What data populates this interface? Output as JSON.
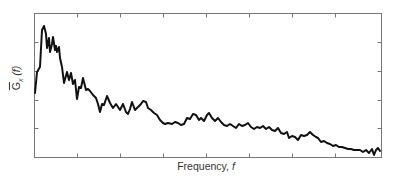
{
  "chart_data": {
    "type": "line",
    "title": "",
    "xlabel": "Frequency, f",
    "ylabel": "G_x(f) (averaged spectral density, overbar)",
    "ylabel_parts": {
      "symbol": "G",
      "subscript": "x",
      "argument": "(f)"
    },
    "xlabel_parts": {
      "text": "Frequency, ",
      "var": "f"
    },
    "x_ticks_labeled": false,
    "y_ticks_labeled": false,
    "grid": false,
    "legend": null,
    "frame": {
      "left": 34,
      "top": 13,
      "right": 381,
      "bottom": 157,
      "color": "#777777"
    },
    "x_tick_positions_px": [
      77,
      120,
      163,
      206,
      249,
      292,
      335
    ],
    "y_tick_positions_px": [
      42,
      71,
      100,
      128
    ],
    "line_color": "#111111",
    "series": [
      {
        "name": "spectrum",
        "points_px": [
          [
            35,
            93
          ],
          [
            37,
            72
          ],
          [
            40,
            67
          ],
          [
            42,
            30
          ],
          [
            44,
            26
          ],
          [
            46,
            34
          ],
          [
            47,
            48
          ],
          [
            49,
            38
          ],
          [
            50,
            52
          ],
          [
            52,
            44
          ],
          [
            53,
            37
          ],
          [
            55,
            50
          ],
          [
            56,
            46
          ],
          [
            57,
            52
          ],
          [
            59,
            47
          ],
          [
            60,
            58
          ],
          [
            62,
            67
          ],
          [
            64,
            83
          ],
          [
            67,
            72
          ],
          [
            69,
            80
          ],
          [
            71,
            73
          ],
          [
            73,
            84
          ],
          [
            75,
            80
          ],
          [
            77,
            99
          ],
          [
            79,
            87
          ],
          [
            81,
            88
          ],
          [
            83,
            78
          ],
          [
            86,
            90
          ],
          [
            88,
            89
          ],
          [
            90,
            91
          ],
          [
            93,
            95
          ],
          [
            96,
            98
          ],
          [
            98,
            104
          ],
          [
            100,
            112
          ],
          [
            102,
            104
          ],
          [
            104,
            105
          ],
          [
            107,
            96
          ],
          [
            110,
            103
          ],
          [
            113,
            108
          ],
          [
            116,
            104
          ],
          [
            118,
            107
          ],
          [
            120,
            110
          ],
          [
            123,
            104
          ],
          [
            126,
            112
          ],
          [
            128,
            114
          ],
          [
            130,
            109
          ],
          [
            132,
            102
          ],
          [
            135,
            110
          ],
          [
            138,
            107
          ],
          [
            141,
            104
          ],
          [
            143,
            101
          ],
          [
            146,
            102
          ],
          [
            148,
            108
          ],
          [
            151,
            110
          ],
          [
            154,
            113
          ],
          [
            157,
            115
          ],
          [
            160,
            120
          ],
          [
            163,
            123
          ],
          [
            165,
            124
          ],
          [
            168,
            123
          ],
          [
            172,
            124
          ],
          [
            175,
            122
          ],
          [
            178,
            123
          ],
          [
            181,
            125
          ],
          [
            184,
            124
          ],
          [
            187,
            118
          ],
          [
            190,
            119
          ],
          [
            193,
            114
          ],
          [
            196,
            115
          ],
          [
            199,
            120
          ],
          [
            201,
            118
          ],
          [
            204,
            121
          ],
          [
            207,
            115
          ],
          [
            209,
            113
          ],
          [
            212,
            118
          ],
          [
            215,
            121
          ],
          [
            218,
            118
          ],
          [
            221,
            122
          ],
          [
            224,
            125
          ],
          [
            227,
            126
          ],
          [
            230,
            124
          ],
          [
            233,
            126
          ],
          [
            236,
            128
          ],
          [
            239,
            124
          ],
          [
            242,
            126
          ],
          [
            245,
            125
          ],
          [
            248,
            123
          ],
          [
            251,
            127
          ],
          [
            254,
            129
          ],
          [
            257,
            127
          ],
          [
            260,
            128
          ],
          [
            263,
            126
          ],
          [
            266,
            129
          ],
          [
            269,
            127
          ],
          [
            272,
            130
          ],
          [
            275,
            131
          ],
          [
            278,
            128
          ],
          [
            281,
            133
          ],
          [
            284,
            134
          ],
          [
            287,
            132
          ],
          [
            289,
            138
          ],
          [
            292,
            136
          ],
          [
            295,
            137
          ],
          [
            298,
            140
          ],
          [
            301,
            135
          ],
          [
            304,
            136
          ],
          [
            307,
            135
          ],
          [
            310,
            132
          ],
          [
            313,
            135
          ],
          [
            316,
            137
          ],
          [
            318,
            138
          ],
          [
            321,
            142
          ],
          [
            324,
            141
          ],
          [
            327,
            143
          ],
          [
            330,
            144
          ],
          [
            333,
            146
          ],
          [
            336,
            145
          ],
          [
            339,
            147
          ],
          [
            342,
            147
          ],
          [
            345,
            148
          ],
          [
            348,
            149
          ],
          [
            351,
            149
          ],
          [
            354,
            150
          ],
          [
            357,
            150
          ],
          [
            360,
            150
          ],
          [
            363,
            152
          ],
          [
            366,
            150
          ],
          [
            369,
            153
          ],
          [
            372,
            149
          ],
          [
            374,
            155
          ],
          [
            376,
            150
          ],
          [
            378,
            148
          ],
          [
            380,
            151
          ]
        ]
      }
    ]
  }
}
